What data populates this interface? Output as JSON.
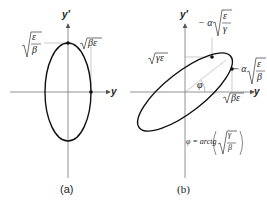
{
  "panels": [
    {
      "id": "a",
      "caption": "(a)",
      "axis_x_label": "y",
      "axis_y_label": "y′",
      "labels": {
        "top_left": "√(ε/β)",
        "top_right": "√(βε)",
        "top_left_num": "ε",
        "top_left_den": "β",
        "top_right_text": "βε"
      }
    },
    {
      "id": "b",
      "caption": "(b)",
      "axis_x_label": "y",
      "axis_y_label": "y′",
      "labels": {
        "top_point": "−α√(ε/γ)",
        "top_point_prefix": "− α",
        "top_point_num": "ε",
        "top_point_den": "γ",
        "right_point": "−α√(ε/β)",
        "right_point_prefix": "− α",
        "right_point_num": "ε",
        "right_point_den": "β",
        "y_intercept": "√(γε)",
        "y_intercept_text": "γε",
        "x_intercept": "√(βε)",
        "x_intercept_text": "βε",
        "angle": "φ",
        "formula": "φ = arctg (√(γ/β))",
        "formula_prefix": "φ = arctg",
        "formula_num": "γ",
        "formula_den": "β"
      }
    }
  ]
}
